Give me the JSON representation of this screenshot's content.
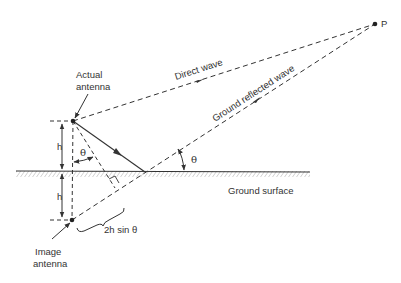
{
  "diagram": {
    "colors": {
      "line": "#333333",
      "hatch": "#8a8a8a",
      "background": "#ffffff"
    },
    "labels": {
      "actual_antenna_line1": "Actual",
      "actual_antenna_line2": "antenna",
      "image_antenna_line1": "Image",
      "image_antenna_line2": "antenna",
      "direct_wave": "Direct wave",
      "ground_reflected_wave": "Ground reflected wave",
      "ground_surface": "Ground surface",
      "point": "P",
      "height_upper": "h",
      "height_lower": "h",
      "theta_at_antenna": "θ",
      "theta_at_ground": "θ",
      "path_difference": "2h sin θ"
    },
    "points": {
      "actual_antenna": [
        73,
        121
      ],
      "image_antenna": [
        72,
        220
      ],
      "reflection_point": [
        145,
        172
      ],
      "P": [
        375,
        24
      ]
    }
  }
}
